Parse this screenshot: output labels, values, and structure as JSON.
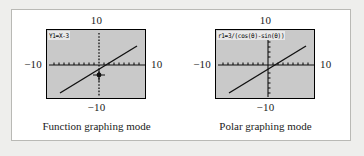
{
  "figure": {
    "panels": [
      {
        "id": "function-mode",
        "equation": "Y1=X-3",
        "range_top": "10",
        "range_bottom": "−10",
        "range_left": "−10",
        "range_right": "10",
        "caption": "Function graphing mode",
        "has_cursor_marker": true,
        "graph": {
          "type": "line",
          "xlim": [
            -10,
            10
          ],
          "ylim": [
            -10,
            10
          ],
          "expression": "y = x - 3",
          "slope": 1,
          "intercept": -3,
          "x_axis_style": "dotted-ticks",
          "y_axis_style": "dotted-ticks",
          "cursor_point": [
            1.2,
            -1.8
          ]
        }
      },
      {
        "id": "polar-mode",
        "equation": "r1=3/(cos(θ)-sin(θ))",
        "range_top": "10",
        "range_bottom": "−10",
        "range_left": "−10",
        "range_right": "10",
        "caption": "Polar graphing mode",
        "has_cursor_marker": false,
        "graph": {
          "type": "line",
          "xlim": [
            -10,
            10
          ],
          "ylim": [
            -10,
            10
          ],
          "expression": "r = 3/(cos(θ) - sin(θ))",
          "slope": 1,
          "intercept": -3,
          "x_axis_style": "dotted-ticks",
          "y_axis_style": "solid-with-ticks",
          "cursor_point": null
        }
      }
    ]
  },
  "colors": {
    "page_background": "#eeeeec",
    "card_background": "#ffffff",
    "card_border": "#b9b9b5",
    "screen_background": "#c9c9c9",
    "screen_border": "#000000",
    "plot_ink": "#111111",
    "equation_bar": "#e8e8e8",
    "text": "#1b1b1b"
  }
}
